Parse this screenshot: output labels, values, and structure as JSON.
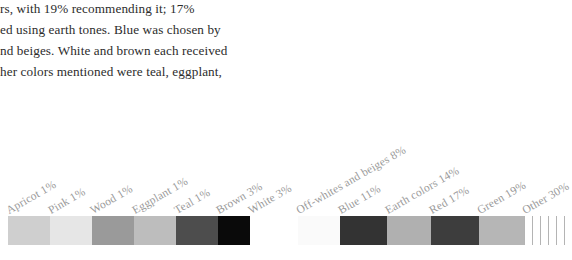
{
  "body_text": {
    "lines": [
      "rs, with 19% recommending it; 17%",
      "ed using earth tones. Blue was chosen by",
      "nd beiges. White and brown each received",
      "her colors mentioned were teal, eggplant,"
    ]
  },
  "chart_data": {
    "type": "bar",
    "title": "",
    "subtitle": "",
    "xlabel": "",
    "ylabel": "",
    "orientation": "horizontal-stacked",
    "grid": false,
    "legend": "none",
    "categories": [
      "Apricot",
      "Pink",
      "Wood",
      "Eggplant",
      "Teal",
      "Brown",
      "White",
      "Off-whites and beiges",
      "Blue",
      "Earth colors",
      "Red",
      "Green",
      "Other"
    ],
    "values": [
      1,
      1,
      1,
      1,
      1,
      3,
      3,
      8,
      11,
      14,
      17,
      19,
      30
    ],
    "unit": "%",
    "labels": [
      "Apricot 1%",
      "Pink 1%",
      "Wood 1%",
      "Eggplant 1%",
      "Teal 1%",
      "Brown 3%",
      "White 3%",
      "Off-whites and beiges 8%",
      "Blue 11%",
      "Earth colors 14%",
      "Red 17%",
      "Green 19%",
      "Other 30%"
    ],
    "segment_colors": [
      "#cfcfcf",
      "#e6e6e6",
      "#9a9a9a",
      "#bdbdbd",
      "#4d4d4d",
      "#0a0a0a",
      "#ffffff",
      "#fafafa",
      "#333333",
      "#b0b0b0",
      "#3d3d3d",
      "#b6b6b6",
      "#ffffff"
    ],
    "segment_widths_px": [
      42,
      42,
      42,
      42,
      42,
      32,
      48,
      42,
      47,
      44,
      48,
      45,
      48
    ],
    "segment_fill_styles": [
      "solid",
      "solid",
      "solid",
      "solid",
      "solid",
      "solid",
      "solid",
      "solid",
      "solid",
      "solid",
      "solid",
      "solid",
      "vertical-hatch"
    ],
    "hatch_color": "#b4b4b4",
    "label_angle_deg": -30,
    "label_color": "#9a9a9a"
  }
}
